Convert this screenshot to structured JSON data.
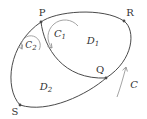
{
  "figure": {
    "points": {
      "p": {
        "label": "P"
      },
      "r": {
        "label": "R"
      },
      "q": {
        "label": "Q"
      },
      "s": {
        "label": "S"
      }
    },
    "curves": {
      "c1": {
        "base": "C",
        "sub": "1"
      },
      "c2": {
        "base": "C",
        "sub": "2"
      },
      "c": {
        "base": "C"
      }
    },
    "regions": {
      "d1": {
        "base": "D",
        "sub": "1"
      },
      "d2": {
        "base": "D",
        "sub": "2"
      }
    },
    "colors": {
      "line": "#4a4a4a",
      "arrow": "#9a9a9a",
      "text": "#333333",
      "background": "#ffffff"
    }
  }
}
